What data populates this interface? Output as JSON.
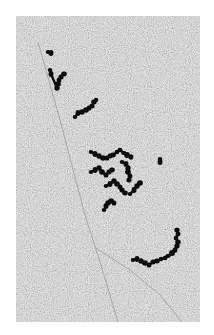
{
  "image": {
    "kind": "electron-micrograph",
    "description": "Grayscale electron micrograph showing dark beaded chain-like strands (polysome-like clusters) scattered over a fine-grained gray background, with faint diagonal fibers crossing the field.",
    "border_color": "#ffffff",
    "field": {
      "x": 16,
      "y": 16,
      "width": 184,
      "height": 306
    },
    "colors": {
      "background_gray": "#c4c4c4",
      "grain_dark": "#8a8a8a",
      "grain_light": "#e6e6e6",
      "strand": "#111111",
      "fiber": "#7a7a7a"
    },
    "fibers": [
      {
        "name": "main-diagonal-fiber",
        "points": [
          [
            38,
            42
          ],
          [
            60,
            120
          ],
          [
            85,
            215
          ],
          [
            100,
            262
          ],
          [
            118,
            322
          ]
        ]
      },
      {
        "name": "lower-faint-fiber",
        "points": [
          [
            96,
            248
          ],
          [
            130,
            270
          ],
          [
            160,
            295
          ],
          [
            182,
            322
          ]
        ]
      }
    ],
    "strands": [
      {
        "name": "top-left-dot",
        "beads": [
          [
            48,
            52
          ],
          [
            51,
            53
          ]
        ]
      },
      {
        "name": "top-left-chain",
        "beads": [
          [
            50,
            70
          ],
          [
            51,
            74
          ],
          [
            57,
            88
          ],
          [
            58,
            84
          ],
          [
            59,
            80
          ],
          [
            61,
            77
          ],
          [
            64,
            74
          ]
        ]
      },
      {
        "name": "upper-chain",
        "beads": [
          [
            75,
            117
          ],
          [
            78,
            113
          ],
          [
            82,
            112
          ],
          [
            86,
            110
          ],
          [
            89,
            108
          ],
          [
            92,
            106
          ],
          [
            94,
            102
          ],
          [
            96,
            100
          ]
        ]
      },
      {
        "name": "middle-cluster-top",
        "beads": [
          [
            91,
            152
          ],
          [
            95,
            154
          ],
          [
            99,
            156
          ],
          [
            103,
            158
          ],
          [
            107,
            158
          ],
          [
            110,
            156
          ],
          [
            113,
            155
          ],
          [
            117,
            152
          ],
          [
            120,
            150
          ],
          [
            124,
            153
          ],
          [
            127,
            155
          ],
          [
            131,
            157
          ]
        ]
      },
      {
        "name": "middle-cluster-left",
        "beads": [
          [
            91,
            172
          ],
          [
            95,
            170
          ],
          [
            99,
            168
          ],
          [
            102,
            172
          ],
          [
            106,
            175
          ],
          [
            109,
            172
          ],
          [
            112,
            170
          ]
        ]
      },
      {
        "name": "middle-cluster-right",
        "beads": [
          [
            122,
            162
          ],
          [
            126,
            164
          ],
          [
            128,
            168
          ],
          [
            128,
            172
          ],
          [
            130,
            176
          ],
          [
            129,
            180
          ]
        ]
      },
      {
        "name": "middle-cluster-center",
        "beads": [
          [
            106,
            186
          ],
          [
            110,
            184
          ],
          [
            114,
            181
          ],
          [
            117,
            184
          ],
          [
            120,
            187
          ],
          [
            122,
            190
          ],
          [
            125,
            193
          ]
        ]
      },
      {
        "name": "middle-cluster-hook",
        "beads": [
          [
            130,
            194
          ],
          [
            134,
            190
          ],
          [
            137,
            186
          ],
          [
            140,
            183
          ]
        ]
      },
      {
        "name": "lower-middle-chain",
        "beads": [
          [
            104,
            210
          ],
          [
            106,
            206
          ],
          [
            108,
            203
          ],
          [
            111,
            201
          ],
          [
            114,
            203
          ]
        ]
      },
      {
        "name": "isolated-dot",
        "beads": [
          [
            160,
            159
          ],
          [
            160,
            162
          ]
        ]
      },
      {
        "name": "lower-right-chain",
        "beads": [
          [
            133,
            260
          ],
          [
            137,
            259
          ],
          [
            141,
            261
          ],
          [
            145,
            263
          ],
          [
            149,
            265
          ],
          [
            153,
            262
          ],
          [
            157,
            261
          ],
          [
            161,
            259
          ],
          [
            165,
            258
          ],
          [
            168,
            256
          ],
          [
            172,
            253
          ],
          [
            175,
            250
          ],
          [
            177,
            246
          ],
          [
            178,
            242
          ],
          [
            176,
            238
          ],
          [
            178,
            234
          ],
          [
            177,
            230
          ]
        ]
      }
    ]
  }
}
